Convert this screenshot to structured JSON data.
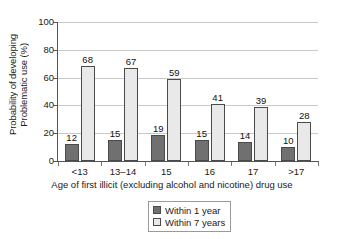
{
  "chart_data": {
    "type": "bar",
    "title": "",
    "subtitle": "",
    "xlabel": "Age of first illicit (excluding alcohol and nicotine) drug use",
    "ylabel": "Probability of developing Problematic use (%)",
    "ylabel_lines": [
      "Probability of developing",
      "Problematic use (%)"
    ],
    "categories": [
      "<13",
      "13–14",
      "15",
      "16",
      "17",
      ">17"
    ],
    "series": [
      {
        "name": "Within 1 year",
        "values": [
          12,
          15,
          19,
          15,
          14,
          10
        ],
        "color": "#707070"
      },
      {
        "name": "Within 7 years",
        "values": [
          68,
          67,
          59,
          41,
          39,
          28
        ],
        "color": "#e9e9e9"
      }
    ],
    "ylim": [
      0,
      100
    ],
    "yticks": [
      0,
      20,
      40,
      60,
      80,
      100
    ],
    "ytick_labels": [
      "0",
      "20",
      "40",
      "60",
      "80",
      "100"
    ],
    "grid": "horizontal",
    "legend_position": "bottom-center",
    "data_labels": true
  },
  "legend": {
    "items": [
      {
        "label": "Within 1 year"
      },
      {
        "label": "Within 7 years"
      }
    ]
  },
  "colors": {
    "series_1_year": "#707070",
    "series_7_years": "#e9e9e9",
    "bar_outline": "#4a4a4a",
    "gridline": "#c9c9c9",
    "axis": "#555555",
    "background": "#ffffff",
    "text": "#1a1a1a"
  }
}
